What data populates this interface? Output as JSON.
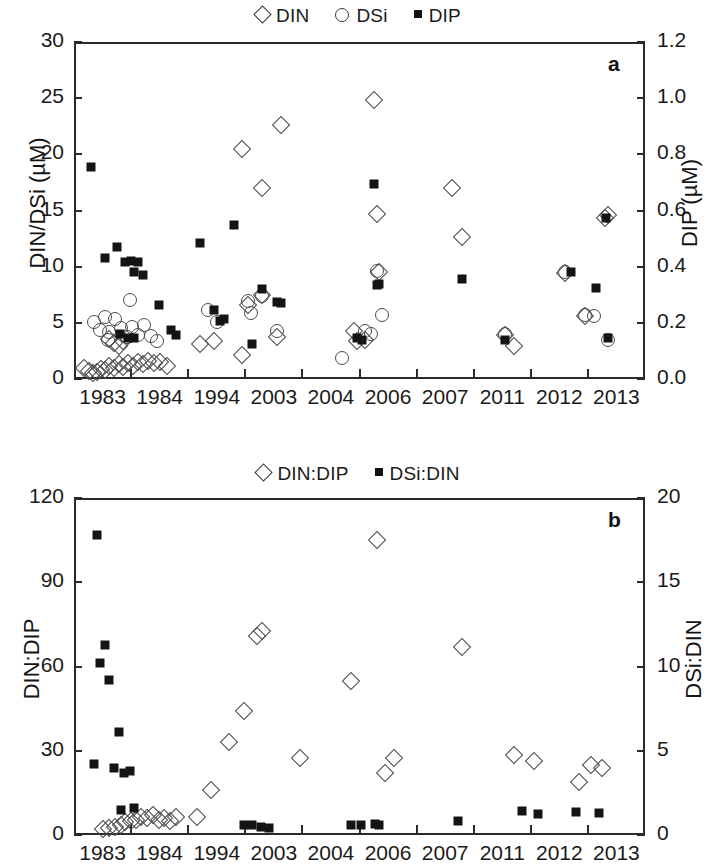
{
  "figure": {
    "panels": [
      "a",
      "b"
    ]
  },
  "chart_data": [
    {
      "type": "scatter",
      "panel_letter": "a",
      "title": "",
      "xlabel": "",
      "ylabel": "DIN/DSi (µM)",
      "y2label": "DIP (µM)",
      "xtick_labels": [
        "1983",
        "1984",
        "1994",
        "2003",
        "2004",
        "2006",
        "2007",
        "2011",
        "2012",
        "2013"
      ],
      "ylim": [
        0,
        30
      ],
      "yticks": [
        0,
        5,
        10,
        15,
        20,
        25,
        30
      ],
      "y2lim": [
        0.0,
        1.2
      ],
      "y2ticks": [
        "0.0",
        "0.2",
        "0.4",
        "0.6",
        "0.8",
        "1.0",
        "1.2"
      ],
      "grid": false,
      "legend_position": "top-center",
      "legend": [
        {
          "name": "DIN",
          "marker": "open-diamond",
          "axis": "left"
        },
        {
          "name": "DSi",
          "marker": "open-circle",
          "axis": "left"
        },
        {
          "name": "DIP",
          "marker": "filled-square",
          "axis": "right"
        }
      ],
      "series": [
        {
          "name": "DIN",
          "marker": "open-diamond",
          "axis": "left",
          "points": [
            [
              0.18,
              1.0
            ],
            [
              0.26,
              0.7
            ],
            [
              0.33,
              0.5
            ],
            [
              0.4,
              0.6
            ],
            [
              0.47,
              0.9
            ],
            [
              0.55,
              0.8
            ],
            [
              0.62,
              1.2
            ],
            [
              0.7,
              1.0
            ],
            [
              0.78,
              1.3
            ],
            [
              0.86,
              1.1
            ],
            [
              0.95,
              1.4
            ],
            [
              1.03,
              1.2
            ],
            [
              1.12,
              1.5
            ],
            [
              1.2,
              1.3
            ],
            [
              1.3,
              1.6
            ],
            [
              1.4,
              1.4
            ],
            [
              0.62,
              3.6
            ],
            [
              0.7,
              3.2
            ],
            [
              0.78,
              2.9
            ],
            [
              0.86,
              3.4
            ],
            [
              1.5,
              1.5
            ],
            [
              1.62,
              1.2
            ],
            [
              2.2,
              3.1
            ],
            [
              2.45,
              3.4
            ],
            [
              2.95,
              20.5
            ],
            [
              3.3,
              17.0
            ],
            [
              3.62,
              22.6
            ],
            [
              3.3,
              7.5
            ],
            [
              3.05,
              6.6
            ],
            [
              3.55,
              3.7
            ],
            [
              2.95,
              2.1
            ],
            [
              4.9,
              4.3
            ],
            [
              4.95,
              3.4
            ],
            [
              5.25,
              24.8
            ],
            [
              5.3,
              14.7
            ],
            [
              5.35,
              9.5
            ],
            [
              5.1,
              3.5
            ],
            [
              6.62,
              17.0
            ],
            [
              6.8,
              12.6
            ],
            [
              7.55,
              3.9
            ],
            [
              7.7,
              2.9
            ],
            [
              8.6,
              9.4
            ],
            [
              8.95,
              5.6
            ],
            [
              9.3,
              14.3
            ],
            [
              9.35,
              14.6
            ]
          ]
        },
        {
          "name": "DSi",
          "marker": "open-circle",
          "axis": "left",
          "points": [
            [
              0.35,
              5.1
            ],
            [
              0.45,
              4.4
            ],
            [
              0.55,
              5.5
            ],
            [
              0.62,
              4.2
            ],
            [
              0.72,
              5.3
            ],
            [
              0.82,
              4.5
            ],
            [
              0.92,
              3.7
            ],
            [
              1.02,
              4.6
            ],
            [
              1.12,
              3.9
            ],
            [
              1.22,
              4.8
            ],
            [
              1.35,
              3.8
            ],
            [
              0.98,
              7.0
            ],
            [
              0.6,
              3.5
            ],
            [
              1.45,
              3.4
            ],
            [
              2.35,
              6.1
            ],
            [
              2.5,
              5.1
            ],
            [
              3.05,
              6.9
            ],
            [
              3.1,
              5.9
            ],
            [
              3.3,
              7.4
            ],
            [
              3.55,
              4.3
            ],
            [
              4.7,
              1.9
            ],
            [
              5.1,
              4.3
            ],
            [
              5.2,
              4.0
            ],
            [
              5.3,
              9.6
            ],
            [
              5.4,
              5.7
            ],
            [
              7.55,
              4.0
            ],
            [
              8.6,
              9.5
            ],
            [
              8.95,
              5.7
            ],
            [
              9.1,
              5.6
            ],
            [
              9.35,
              3.5
            ]
          ]
        },
        {
          "name": "DIP",
          "marker": "filled-square",
          "axis": "right",
          "points": [
            [
              0.3,
              0.755
            ],
            [
              0.55,
              0.43
            ],
            [
              0.75,
              0.47
            ],
            [
              0.9,
              0.415
            ],
            [
              1.0,
              0.42
            ],
            [
              1.05,
              0.38
            ],
            [
              1.12,
              0.415
            ],
            [
              1.2,
              0.37
            ],
            [
              0.8,
              0.16
            ],
            [
              0.95,
              0.145
            ],
            [
              1.05,
              0.145
            ],
            [
              1.48,
              0.265
            ],
            [
              1.7,
              0.175
            ],
            [
              1.78,
              0.155
            ],
            [
              2.2,
              0.485
            ],
            [
              2.45,
              0.245
            ],
            [
              2.55,
              0.205
            ],
            [
              2.62,
              0.215
            ],
            [
              2.8,
              0.55
            ],
            [
              3.3,
              0.32
            ],
            [
              3.55,
              0.275
            ],
            [
              3.62,
              0.27
            ],
            [
              3.12,
              0.125
            ],
            [
              4.95,
              0.145
            ],
            [
              5.05,
              0.14
            ],
            [
              5.25,
              0.695
            ],
            [
              5.35,
              0.34
            ],
            [
              5.3,
              0.335
            ],
            [
              6.8,
              0.355
            ],
            [
              7.55,
              0.14
            ],
            [
              8.7,
              0.38
            ],
            [
              9.15,
              0.325
            ],
            [
              9.32,
              0.575
            ],
            [
              9.35,
              0.145
            ]
          ]
        }
      ]
    },
    {
      "type": "scatter",
      "panel_letter": "b",
      "title": "",
      "xlabel": "",
      "ylabel": "DIN:DIP",
      "y2label": "DSi:DIN",
      "xtick_labels": [
        "1983",
        "1984",
        "1994",
        "2003",
        "2004",
        "2006",
        "2007",
        "2011",
        "2012",
        "2013"
      ],
      "ylim": [
        0,
        120
      ],
      "yticks": [
        0,
        30,
        60,
        90,
        120
      ],
      "y2lim": [
        0,
        20
      ],
      "y2ticks": [
        0,
        5,
        10,
        15,
        20
      ],
      "grid": false,
      "legend_position": "top-center",
      "legend": [
        {
          "name": "DIN:DIP",
          "marker": "open-diamond",
          "axis": "left"
        },
        {
          "name": "DSi:DIN",
          "marker": "filled-square",
          "axis": "right"
        }
      ],
      "series": [
        {
          "name": "DIN:DIP",
          "marker": "open-diamond",
          "axis": "left",
          "points": [
            [
              0.5,
              2.0
            ],
            [
              0.62,
              2.5
            ],
            [
              0.72,
              3.0
            ],
            [
              0.82,
              3.5
            ],
            [
              0.9,
              4.5
            ],
            [
              1.0,
              5.0
            ],
            [
              1.08,
              5.5
            ],
            [
              1.18,
              6.5
            ],
            [
              1.28,
              6.0
            ],
            [
              1.38,
              7.0
            ],
            [
              1.48,
              5.5
            ],
            [
              1.58,
              6.0
            ],
            [
              1.68,
              5.0
            ],
            [
              1.78,
              6.5
            ],
            [
              2.15,
              6.5
            ],
            [
              2.4,
              16.0
            ],
            [
              2.72,
              33.0
            ],
            [
              2.98,
              44.0
            ],
            [
              3.2,
              71.0
            ],
            [
              3.3,
              72.5
            ],
            [
              3.95,
              27.5
            ],
            [
              4.85,
              55.0
            ],
            [
              5.3,
              105.0
            ],
            [
              5.45,
              22.0
            ],
            [
              5.6,
              27.5
            ],
            [
              6.8,
              67.0
            ],
            [
              7.7,
              28.5
            ],
            [
              8.05,
              26.5
            ],
            [
              8.85,
              19.0
            ],
            [
              9.05,
              25.0
            ],
            [
              9.25,
              24.0
            ]
          ]
        },
        {
          "name": "DSi:DIN",
          "marker": "filled-square",
          "axis": "right",
          "points": [
            [
              0.4,
              17.8
            ],
            [
              0.55,
              11.3
            ],
            [
              0.45,
              10.2
            ],
            [
              0.62,
              9.2
            ],
            [
              0.78,
              6.1
            ],
            [
              0.35,
              4.2
            ],
            [
              0.7,
              4.0
            ],
            [
              0.88,
              3.7
            ],
            [
              0.98,
              3.8
            ],
            [
              0.82,
              1.5
            ],
            [
              1.05,
              1.6
            ],
            [
              2.98,
              0.6
            ],
            [
              3.12,
              0.6
            ],
            [
              3.28,
              0.45
            ],
            [
              3.42,
              0.4
            ],
            [
              4.85,
              0.6
            ],
            [
              5.02,
              0.6
            ],
            [
              5.28,
              0.65
            ],
            [
              5.35,
              0.62
            ],
            [
              6.72,
              0.85
            ],
            [
              7.85,
              1.45
            ],
            [
              8.12,
              1.25
            ],
            [
              8.8,
              1.35
            ],
            [
              9.2,
              1.3
            ]
          ]
        }
      ]
    }
  ]
}
